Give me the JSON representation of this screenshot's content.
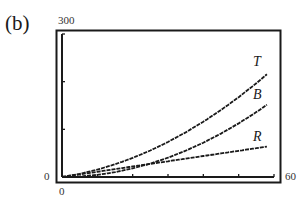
{
  "panel_label": "(b)",
  "axes": {
    "y_max_label": "300",
    "y_min_label": "0",
    "x_min_label": "0",
    "x_max_label": "60"
  },
  "chart_data": {
    "type": "line",
    "title": "",
    "xlabel": "",
    "ylabel": "",
    "xlim": [
      0,
      60
    ],
    "ylim": [
      0,
      300
    ],
    "x_ticks": [
      0,
      10,
      20,
      30,
      40,
      50,
      60
    ],
    "y_ticks": [
      0,
      100,
      200,
      300
    ],
    "grid": false,
    "legend": "inline labels at right end of curves",
    "x": [
      0,
      5,
      10,
      15,
      20,
      25,
      30,
      35,
      40,
      45,
      50,
      55,
      60
    ],
    "series": [
      {
        "name": "T",
        "values": [
          0,
          6.6,
          15.5,
          26.6,
          40.0,
          55.6,
          73.5,
          93.6,
          116.0,
          140.6,
          167.5,
          196.6,
          228.0
        ]
      },
      {
        "name": "B",
        "values": [
          0,
          1.1,
          4.5,
          10.1,
          18.0,
          28.1,
          40.5,
          55.1,
          72.0,
          91.1,
          112.5,
          136.1,
          162.0
        ]
      },
      {
        "name": "R",
        "values": [
          0,
          5.5,
          11.0,
          16.5,
          22.0,
          27.5,
          33.0,
          38.5,
          44.0,
          49.5,
          55.0,
          60.5,
          66.0
        ]
      }
    ]
  }
}
